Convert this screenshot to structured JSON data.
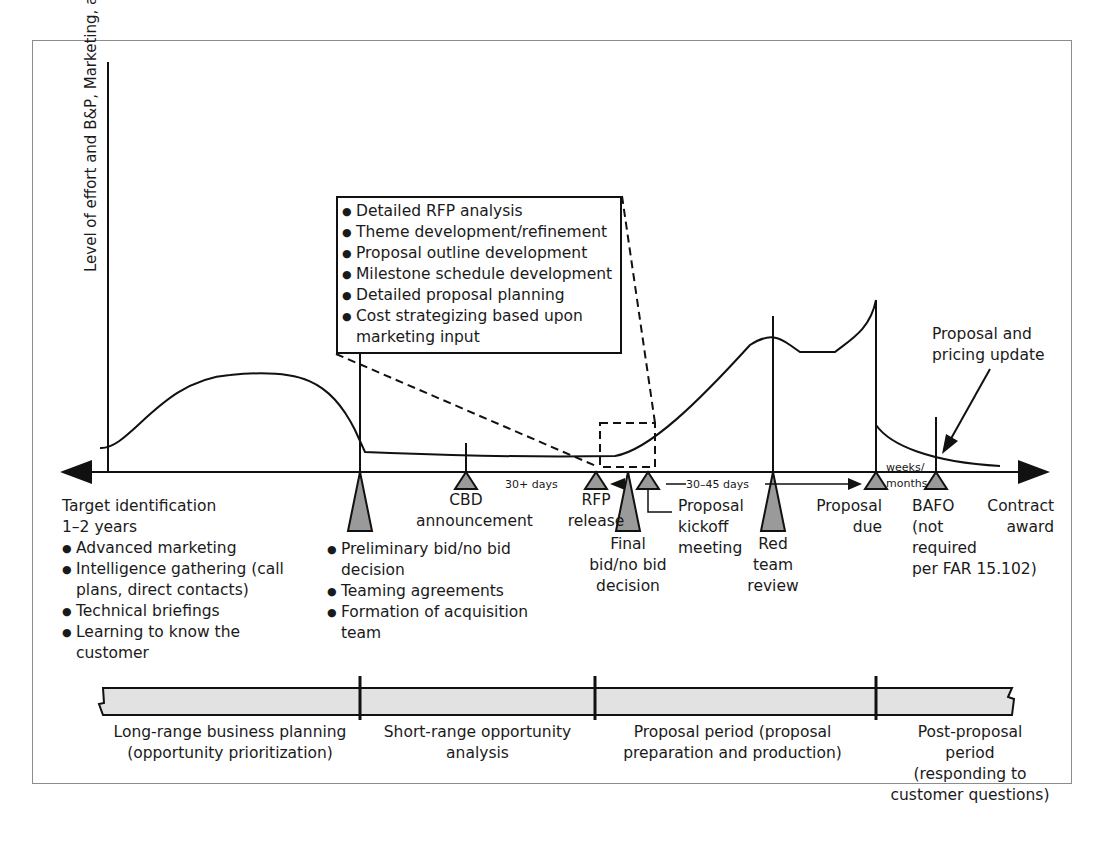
{
  "figure": {
    "y_axis_label": "Level of effort and B&P, Marketing, and IR&D $",
    "callout": {
      "items": [
        "Detailed RFP analysis",
        "Theme development/refinement",
        "Proposal outline development",
        "Milestone schedule development",
        "Detailed proposal planning",
        "Cost strategizing based upon marketing input"
      ]
    },
    "milestones": {
      "target_identification": {
        "title": "Target identification",
        "duration": "1–2 years",
        "items": [
          "Advanced marketing",
          "Intelligence gathering (call plans, direct contacts)",
          "Technical briefings",
          "Learning to know the customer"
        ]
      },
      "preliminary": {
        "items": [
          "Preliminary bid/no bid decision",
          "Teaming agreements",
          "Formation of acquisition team"
        ]
      },
      "cbd": {
        "line1": "CBD",
        "line2": "announcement"
      },
      "rfp": {
        "line1": "RFP",
        "line2": "release"
      },
      "final_bid": {
        "line1": "Final",
        "line2": "bid/no bid",
        "line3": "decision"
      },
      "kickoff": {
        "line1": "Proposal",
        "line2": "kickoff",
        "line3": "meeting"
      },
      "red_team": {
        "line1": "Red",
        "line2": "team",
        "line3": "review"
      },
      "proposal_due": {
        "line1": "Proposal",
        "line2": "due"
      },
      "bafo": {
        "line1": "BAFO",
        "line2": "(not",
        "line3": "required",
        "line4": "per FAR 15.102)"
      },
      "contract_award": {
        "line1": "Contract",
        "line2": "award"
      }
    },
    "intervals": {
      "thirty_plus": "30+ days",
      "thirty_45": "30–45 days",
      "weeks_months_1": "weeks/",
      "weeks_months_2": "months"
    },
    "annotation_update": {
      "line1": "Proposal and",
      "line2": "pricing update"
    },
    "periods": [
      {
        "line1": "Long-range business planning",
        "line2": "(opportunity prioritization)"
      },
      {
        "line1": "Short-range opportunity",
        "line2": "analysis"
      },
      {
        "line1": "Proposal period (proposal",
        "line2": "preparation and production)"
      },
      {
        "line1": "Post-proposal",
        "line2": "period",
        "line3": "(responding to",
        "line4": "customer questions)"
      }
    ],
    "colors": {
      "line": "#111111",
      "marker_fill": "#9a9a9a",
      "band_fill": "#e2e2e2",
      "frame": "#8c8c8c"
    }
  }
}
